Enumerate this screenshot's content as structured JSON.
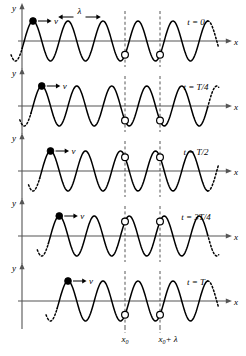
{
  "figure": {
    "axis_labels": {
      "y": "y",
      "x": "x"
    },
    "velocity_label": "v",
    "wavelength_label": "λ",
    "x_marker_labels": {
      "x0": "x",
      "x0_sub": "0",
      "x0_lambda": "x",
      "x0_lambda_sub": "0",
      "x0_lambda_rest": "+ λ"
    },
    "colors": {
      "wave": "#000000",
      "axis": "#555555",
      "dash": "#444444",
      "dot_fill": "#000000",
      "dot_open": "#ffffff",
      "background": "#ffffff"
    },
    "panels": [
      {
        "time_label": "t = 0",
        "phase_shift": 0.0,
        "marker_phase": "zero-crossing-descending"
      },
      {
        "time_label": "t = T/4",
        "phase_shift": 0.25,
        "marker_phase": "crest"
      },
      {
        "time_label": "t = T/2",
        "phase_shift": 0.5,
        "marker_phase": "zero-crossing-ascending"
      },
      {
        "time_label": "t = 3T/4",
        "phase_shift": 0.75,
        "marker_phase": "trough"
      },
      {
        "time_label": "t = T",
        "phase_shift": 1.0,
        "marker_phase": "zero-crossing-descending"
      }
    ]
  },
  "chart_data": {
    "type": "line",
    "xlabel": "x",
    "ylabel": "y",
    "grid": false,
    "legend": "none",
    "wavelength_px": 35,
    "amplitude_px": 20,
    "x_axis_pixel_range": [
      22,
      222
    ],
    "markers": {
      "filled_dot_desc": "particle at x near first crest, moving with wave speed v",
      "open_dot_positions_x": [
        "x0",
        "x0 + λ"
      ]
    },
    "series": [
      {
        "name": "t = 0",
        "phase_fraction_of_period": 0.0,
        "y_at_x0": 0,
        "y_at_x0_plus_lambda": 0
      },
      {
        "name": "t = T/4",
        "phase_fraction_of_period": 0.25,
        "y_at_x0": 20,
        "y_at_x0_plus_lambda": 20
      },
      {
        "name": "t = T/2",
        "phase_fraction_of_period": 0.5,
        "y_at_x0": 0,
        "y_at_x0_plus_lambda": 0
      },
      {
        "name": "t = 3T/4",
        "phase_fraction_of_period": 0.75,
        "y_at_x0": -20,
        "y_at_x0_plus_lambda": -20
      },
      {
        "name": "t = T",
        "phase_fraction_of_period": 1.0,
        "y_at_x0": 0,
        "y_at_x0_plus_lambda": 0
      }
    ]
  }
}
